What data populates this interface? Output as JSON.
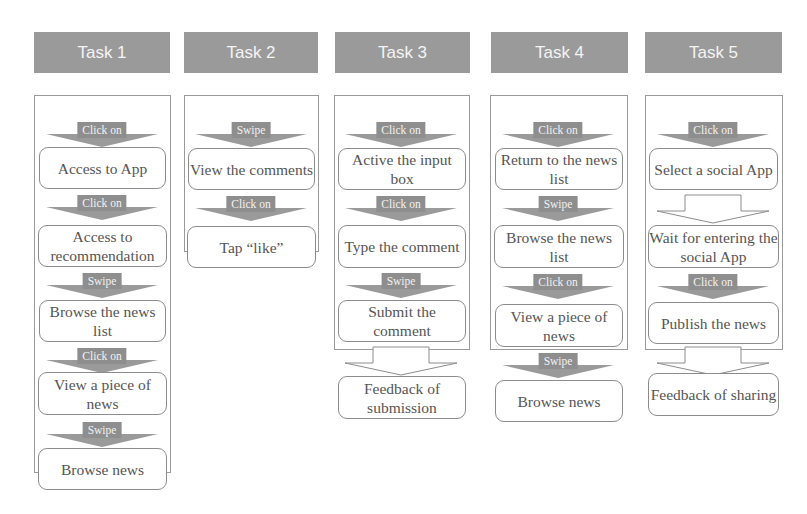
{
  "tasks": [
    {
      "title": "Task 1",
      "steps": [
        {
          "action": "Click on",
          "label": "Access to App"
        },
        {
          "action": "Click on",
          "label": "Access to recommendation"
        },
        {
          "action": "Swipe",
          "label": "Browse the news list"
        },
        {
          "action": "Click on",
          "label": "View a piece of news"
        },
        {
          "action": "Swipe",
          "label": "Browse news"
        }
      ]
    },
    {
      "title": "Task 2",
      "steps": [
        {
          "action": "Swipe",
          "label": "View the comments"
        },
        {
          "action": "Click on",
          "label": "Tap “like”"
        }
      ]
    },
    {
      "title": "Task 3",
      "steps": [
        {
          "action": "Click on",
          "label": "Active the input box"
        },
        {
          "action": "Click on",
          "label": "Type the comment"
        },
        {
          "action": "Swipe",
          "label": "Submit the comment"
        },
        {
          "action": "",
          "label": "Feedback of submission"
        }
      ]
    },
    {
      "title": "Task 4",
      "steps": [
        {
          "action": "Click on",
          "label": "Return to the news list"
        },
        {
          "action": "Swipe",
          "label": "Browse the news list"
        },
        {
          "action": "Click on",
          "label": "View a piece of news"
        },
        {
          "action": "Swipe",
          "label": "Browse news"
        }
      ]
    },
    {
      "title": "Task 5",
      "steps": [
        {
          "action": "Click on",
          "label": "Select a social App"
        },
        {
          "action": "",
          "label": "Wait for entering the  social App"
        },
        {
          "action": "Click on",
          "label": "Publish the news"
        },
        {
          "action": "",
          "label": "Feedback of sharing"
        }
      ]
    }
  ],
  "colors": {
    "header_bg": "#9a9a9a",
    "header_text": "#f4f4f4",
    "action_bg": "#8e8e8e",
    "border": "#8c8c8c"
  }
}
